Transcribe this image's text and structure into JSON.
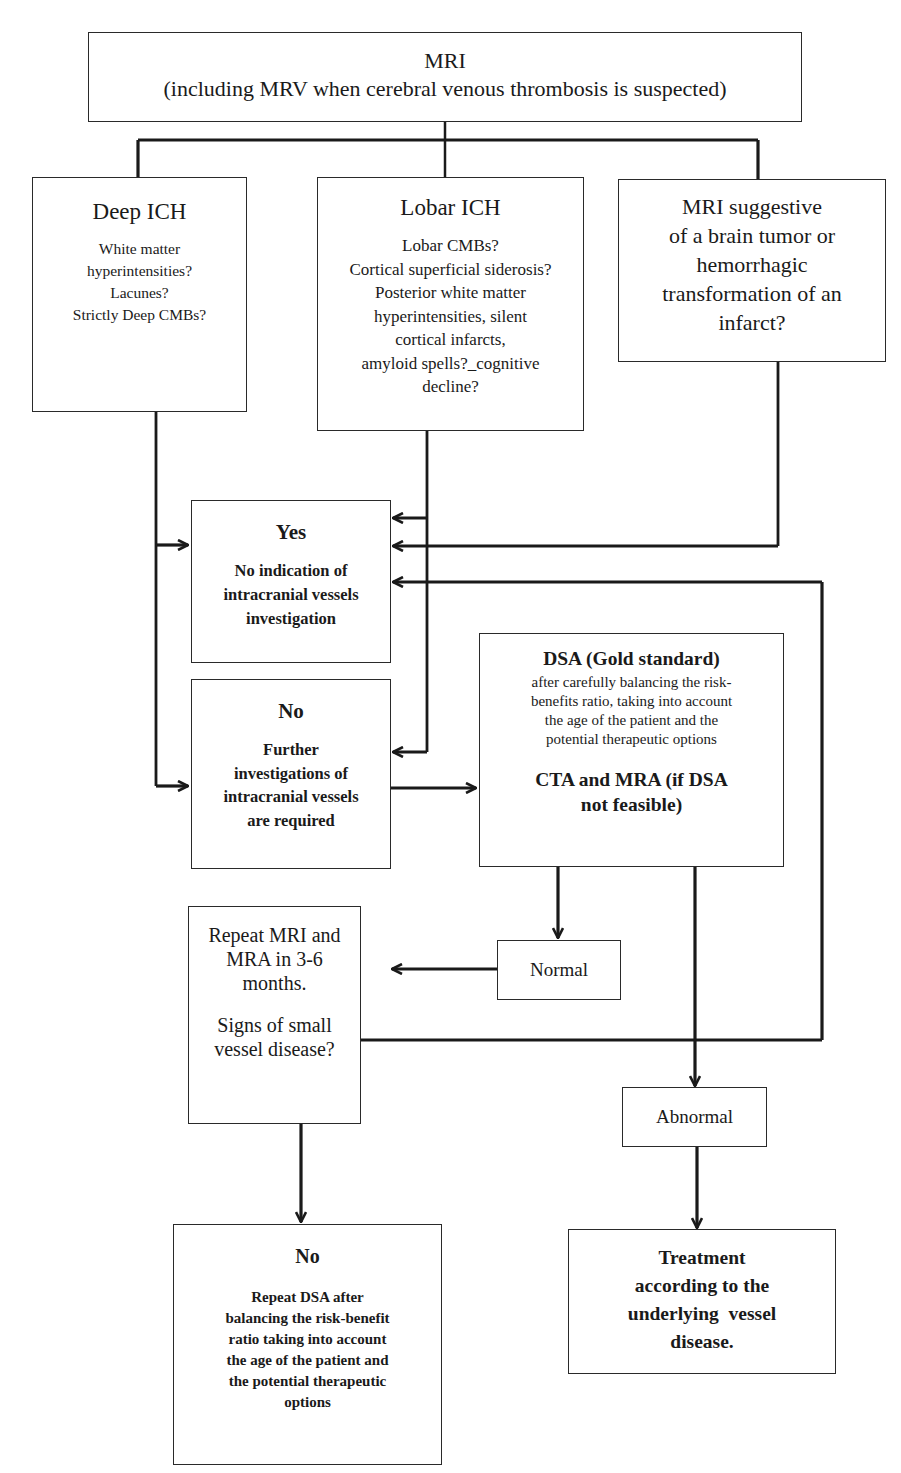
{
  "diagram": {
    "colors": {
      "line": "#1a1a1a",
      "box_border": "#2a2a2a",
      "background": "#ffffff",
      "text": "#1a1a1a"
    },
    "nodes": {
      "mri": {
        "title": "MRI",
        "body": "(including MRV when cerebral venous thrombosis is suspected)"
      },
      "deep_ich": {
        "title": "Deep ICH",
        "body": "White matter\nhyperintensities?\nLacunes?\nStrictly Deep CMBs?"
      },
      "lobar_ich": {
        "title": "Lobar ICH",
        "body": "Lobar CMBs?\nCortical superficial siderosis?\nPosterior white matter\nhyperintensities, silent\ncortical infarcts,\namyloid spells?_cognitive\ndecline?"
      },
      "tumor": {
        "body": "MRI suggestive\nof a brain tumor or\nhemorrhagic\ntransformation of an\ninfarct?"
      },
      "yes": {
        "title": "Yes",
        "body": "No indication of\nintracranial vessels\ninvestigation"
      },
      "no": {
        "title": "No",
        "body": "Further\ninvestigations of\nintracranial vessels\nare required"
      },
      "dsa": {
        "title": "DSA (Gold standard)",
        "body": "after carefully balancing the risk-\nbenefits ratio, taking into account\nthe age of the patient and the\npotential therapeutic options",
        "footer": "CTA and MRA (if DSA\nnot feasible)"
      },
      "normal": {
        "label": "Normal"
      },
      "repeat_mri": {
        "body": "Repeat MRI and\nMRA in 3-6\nmonths.",
        "question": "Signs of small\nvessel disease?"
      },
      "abnormal": {
        "label": "Abnormal"
      },
      "no_repeat_dsa": {
        "title": "No",
        "body": "Repeat DSA after\nbalancing the risk-benefit\nratio taking into account\nthe age of the patient and\nthe potential therapeutic\noptions"
      },
      "treatment": {
        "body": "Treatment\naccording to the\nunderlying  vessel\ndisease."
      }
    },
    "edges": [
      {
        "from": "mri",
        "to": "deep_ich"
      },
      {
        "from": "mri",
        "to": "lobar_ich"
      },
      {
        "from": "mri",
        "to": "tumor"
      },
      {
        "from": "deep_ich",
        "to": "yes"
      },
      {
        "from": "deep_ich",
        "to": "no"
      },
      {
        "from": "lobar_ich",
        "to": "yes"
      },
      {
        "from": "lobar_ich",
        "to": "no"
      },
      {
        "from": "tumor",
        "to": "yes"
      },
      {
        "from": "no",
        "to": "dsa"
      },
      {
        "from": "dsa",
        "to": "normal"
      },
      {
        "from": "dsa",
        "to": "abnormal"
      },
      {
        "from": "normal",
        "to": "repeat_mri"
      },
      {
        "from": "repeat_mri",
        "to": "yes",
        "label": "yes (signs of small vessel disease)"
      },
      {
        "from": "repeat_mri",
        "to": "no_repeat_dsa"
      },
      {
        "from": "abnormal",
        "to": "treatment"
      }
    ]
  }
}
